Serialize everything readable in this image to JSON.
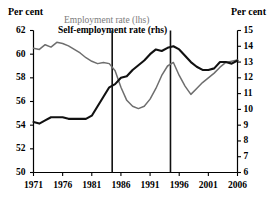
{
  "axis_titles": {
    "left": "Per cent",
    "right": "Per cent"
  },
  "legend": {
    "employment": "Employment rate (lhs)",
    "self_employment": "Self-employment rate (rhs)"
  },
  "colors": {
    "employment_line": "#6e6e6e",
    "self_employment_line": "#111111",
    "axis": "#000000",
    "reference_line": "#111111",
    "background": "#ffffff"
  },
  "chart_data": {
    "type": "line",
    "title": "",
    "xlabel": "",
    "grid": false,
    "legend_position": "top-center",
    "x": [
      1971,
      1972,
      1973,
      1974,
      1975,
      1976,
      1977,
      1978,
      1979,
      1980,
      1981,
      1982,
      1983,
      1984,
      1985,
      1986,
      1987,
      1988,
      1989,
      1990,
      1991,
      1992,
      1993,
      1994,
      1995,
      1996,
      1997,
      1998,
      1999,
      2000,
      2001,
      2002,
      2003,
      2004,
      2005,
      2006
    ],
    "xticks": [
      1971,
      1976,
      1981,
      1986,
      1991,
      1996,
      2001,
      2006
    ],
    "xlim": [
      1971,
      2006
    ],
    "reference_lines": [
      1984.5,
      1994.5
    ],
    "left_axis": {
      "label": "Per cent",
      "ylim": [
        50,
        62
      ],
      "yticks": [
        50,
        52,
        54,
        56,
        58,
        60,
        62
      ]
    },
    "right_axis": {
      "label": "Per cent",
      "ylim": [
        6,
        15
      ],
      "yticks": [
        6,
        7,
        8,
        9,
        10,
        11,
        12,
        13,
        14,
        15
      ]
    },
    "series": [
      {
        "name": "Employment rate (lhs)",
        "axis": "left",
        "color": "#6e6e6e",
        "values": [
          60.5,
          60.4,
          60.8,
          60.6,
          61.0,
          60.9,
          60.7,
          60.4,
          60.1,
          59.7,
          59.4,
          59.2,
          59.3,
          59.2,
          58.6,
          57.2,
          56.1,
          55.6,
          55.4,
          55.6,
          56.2,
          57.1,
          58.2,
          59.0,
          59.3,
          58.2,
          57.3,
          56.6,
          57.1,
          57.6,
          58.0,
          58.4,
          58.9,
          59.3,
          59.4,
          59.5
        ]
      },
      {
        "name": "Self-employment rate (rhs)",
        "axis": "right",
        "color": "#111111",
        "values": [
          9.2,
          9.1,
          9.3,
          9.5,
          9.5,
          9.5,
          9.4,
          9.4,
          9.4,
          9.4,
          9.6,
          10.2,
          10.8,
          11.4,
          11.6,
          12.0,
          12.1,
          12.5,
          12.8,
          13.1,
          13.5,
          13.8,
          13.7,
          13.9,
          14.0,
          13.8,
          13.4,
          13.0,
          12.7,
          12.5,
          12.5,
          12.6,
          13.0,
          13.0,
          12.9,
          13.1
        ]
      }
    ]
  }
}
